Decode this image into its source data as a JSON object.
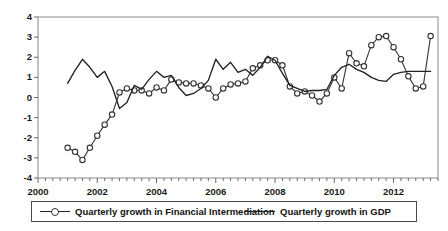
{
  "chart_data": {
    "type": "line",
    "title": "",
    "xlabel": "",
    "ylabel": "",
    "xlim": [
      2000.0,
      2013.5
    ],
    "ylim": [
      -4,
      4
    ],
    "grid": false,
    "legend_position": "bottom",
    "y_ticks": [
      "4",
      "3",
      "2",
      "1",
      "0",
      "-1",
      "-2",
      "-3",
      "-4"
    ],
    "y_tick_values": [
      4,
      3,
      2,
      1,
      0,
      -1,
      -2,
      -3,
      -4
    ],
    "x_ticks": [
      "2000",
      "2002",
      "2004",
      "2006",
      "2008",
      "2010",
      "2012"
    ],
    "x_tick_values": [
      2000,
      2002,
      2004,
      2006,
      2008,
      2010,
      2012
    ],
    "x_minor_tick_step": 0.25,
    "series": [
      {
        "name": "Quarterly growth in Financial Intermediation",
        "marker": "circle-open",
        "color": "#333333",
        "x": [
          2001.0,
          2001.25,
          2001.5,
          2001.75,
          2002.0,
          2002.25,
          2002.5,
          2002.75,
          2003.0,
          2003.25,
          2003.5,
          2003.75,
          2004.0,
          2004.25,
          2004.5,
          2004.75,
          2005.0,
          2005.25,
          2005.5,
          2005.75,
          2006.0,
          2006.25,
          2006.5,
          2006.75,
          2007.0,
          2007.25,
          2007.5,
          2007.75,
          2008.0,
          2008.25,
          2008.5,
          2008.75,
          2009.0,
          2009.25,
          2009.5,
          2009.75,
          2010.0,
          2010.25,
          2010.5,
          2010.75,
          2011.0,
          2011.25,
          2011.5,
          2011.75,
          2012.0,
          2012.25,
          2012.5,
          2012.75,
          2013.0,
          2013.25
        ],
        "values": [
          -2.5,
          -2.7,
          -3.1,
          -2.5,
          -1.9,
          -1.35,
          -0.85,
          0.25,
          0.45,
          0.35,
          0.35,
          0.2,
          0.5,
          0.35,
          0.9,
          0.75,
          0.7,
          0.7,
          0.6,
          0.45,
          0.0,
          0.45,
          0.65,
          0.7,
          0.8,
          1.45,
          1.6,
          1.85,
          1.85,
          1.6,
          0.55,
          0.2,
          0.3,
          0.1,
          -0.2,
          0.2,
          1.0,
          0.45,
          2.2,
          1.7,
          1.55,
          2.6,
          3.0,
          3.05,
          2.5,
          1.9,
          1.05,
          0.45,
          0.55,
          3.05
        ]
      },
      {
        "name": "Quarterly growth in GDP",
        "marker": "none",
        "color": "#222222",
        "x": [
          2001.0,
          2001.25,
          2001.5,
          2001.75,
          2002.0,
          2002.25,
          2002.5,
          2002.75,
          2003.0,
          2003.25,
          2003.5,
          2003.75,
          2004.0,
          2004.25,
          2004.5,
          2004.75,
          2005.0,
          2005.25,
          2005.5,
          2005.75,
          2006.0,
          2006.25,
          2006.5,
          2006.75,
          2007.0,
          2007.25,
          2007.5,
          2007.75,
          2008.0,
          2008.25,
          2008.5,
          2008.75,
          2009.0,
          2009.25,
          2009.5,
          2009.75,
          2010.0,
          2010.25,
          2010.5,
          2010.75,
          2011.0,
          2011.25,
          2011.5,
          2011.75,
          2012.0,
          2012.25,
          2012.5,
          2012.75,
          2013.0,
          2013.25
        ],
        "values": [
          0.7,
          1.35,
          1.9,
          1.5,
          1.0,
          1.3,
          0.55,
          -0.55,
          -0.25,
          0.6,
          0.4,
          0.9,
          1.3,
          1.0,
          1.1,
          0.5,
          0.1,
          0.2,
          0.45,
          0.85,
          1.9,
          1.4,
          1.75,
          1.25,
          1.4,
          1.1,
          1.5,
          2.05,
          1.85,
          1.2,
          0.6,
          0.45,
          0.3,
          0.35,
          0.35,
          0.4,
          1.1,
          1.5,
          1.65,
          1.4,
          1.25,
          1.0,
          0.85,
          0.8,
          1.15,
          1.25,
          1.3,
          1.3,
          1.3,
          1.3
        ]
      }
    ]
  },
  "legend": {
    "entries": [
      {
        "label": "Quarterly growth in Financial Intermediation",
        "marker": "circle-open"
      },
      {
        "label": "Quarterly growth in GDP",
        "marker": "line"
      }
    ]
  }
}
